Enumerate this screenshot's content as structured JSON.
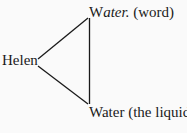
{
  "diagram": {
    "nodes": {
      "helen": {
        "label": "Helen"
      },
      "word": {
        "label_prefix": "W",
        "label_italic": "ater.",
        "label_suffix": " (word)"
      },
      "liquid": {
        "label": "Water (the liquid)"
      }
    },
    "edges": [
      {
        "from": "Helen",
        "to": "Water (word)"
      },
      {
        "from": "Helen",
        "to": "Water (the liquid)"
      },
      {
        "from": "Water (word)",
        "to": "Water (the liquid)"
      }
    ],
    "line_color": "#1a1a1a"
  }
}
